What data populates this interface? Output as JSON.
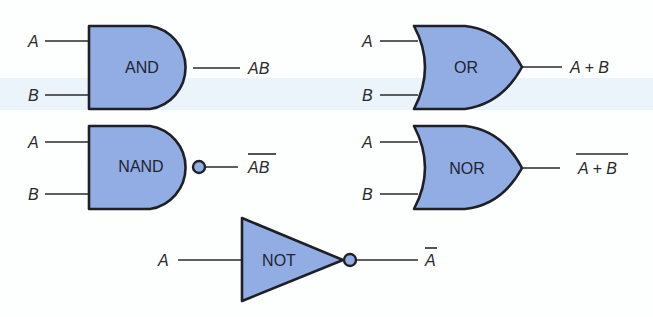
{
  "colors": {
    "gate_fill": "#92ade4",
    "outline": "#1f1f26",
    "background": "#fdfefe"
  },
  "gates": {
    "and": {
      "name": "AND",
      "inputs": [
        "A",
        "B"
      ],
      "output": "AB",
      "output_negated": false
    },
    "or": {
      "name": "OR",
      "inputs": [
        "A",
        "B"
      ],
      "output": "A + B",
      "output_negated": false
    },
    "nand": {
      "name": "NAND",
      "inputs": [
        "A",
        "B"
      ],
      "output": "AB",
      "output_negated": true
    },
    "nor": {
      "name": "NOR",
      "inputs": [
        "A",
        "B"
      ],
      "output": "A + B",
      "output_negated": true
    },
    "not": {
      "name": "NOT",
      "inputs": [
        "A"
      ],
      "output": "A",
      "output_negated": true
    }
  }
}
